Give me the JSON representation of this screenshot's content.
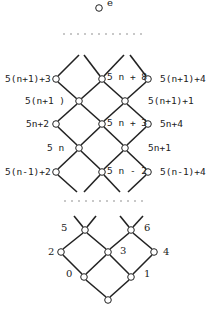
{
  "top": {
    "label": "e"
  },
  "upper_rows": {
    "row_a": {
      "left": "5(n+1)+3",
      "center": "5 n + 8",
      "right": "5(n+1)+4"
    },
    "row_b": {
      "left": "5(n+1 )",
      "right": "5(n+1)+1"
    },
    "row_c": {
      "left": "5n+2",
      "center": "5 n + 3",
      "right": "5n+4"
    },
    "row_d": {
      "left": "5 n",
      "right": "5n+1"
    },
    "row_e": {
      "left": "5(n-1)+2",
      "center": "5 n - 2",
      "right": "5(n-1)+4"
    }
  },
  "lower_rows": {
    "row_1": {
      "left": "5",
      "right": "6"
    },
    "row_2": {
      "left": "2",
      "center": "3",
      "right": "4"
    },
    "row_3": {
      "left": "0",
      "right": "1"
    }
  },
  "ellipsis": "............"
}
